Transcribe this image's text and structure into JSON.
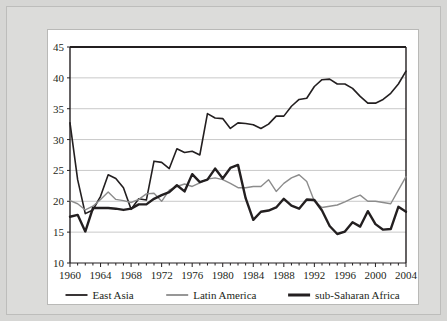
{
  "figure": {
    "frame_background": "#d6d6d4",
    "panel_background": "#ffffff",
    "has_title": false
  },
  "chart_data": {
    "type": "line",
    "title": "",
    "subtitle": "",
    "xlabel": "",
    "ylabel": "",
    "xlim": [
      1960,
      2004
    ],
    "ylim": [
      10,
      45
    ],
    "ytick_labels": [
      "10",
      "15",
      "20",
      "25",
      "30",
      "35",
      "40",
      "45"
    ],
    "yticks": [
      10,
      15,
      20,
      25,
      30,
      35,
      40,
      45
    ],
    "xtick_labels": [
      "1960",
      "1964",
      "1968",
      "1972",
      "1976",
      "1980",
      "1984",
      "1988",
      "1992",
      "1996",
      "2000",
      "2004"
    ],
    "xticks": [
      1960,
      1964,
      1968,
      1972,
      1976,
      1980,
      1984,
      1988,
      1992,
      1996,
      2000,
      2004
    ],
    "minor_xtick_interval": 1,
    "grid": "horizontal",
    "grid_color": "#c9c9c9",
    "axis_color": "#231f20",
    "legend_position": "below-axes",
    "x": [
      1960,
      1961,
      1962,
      1963,
      1964,
      1965,
      1966,
      1967,
      1968,
      1969,
      1970,
      1971,
      1972,
      1973,
      1974,
      1975,
      1976,
      1977,
      1978,
      1979,
      1980,
      1981,
      1982,
      1983,
      1984,
      1985,
      1986,
      1987,
      1988,
      1989,
      1990,
      1991,
      1992,
      1993,
      1994,
      1995,
      1996,
      1997,
      1998,
      1999,
      2000,
      2001,
      2002,
      2003,
      2004
    ],
    "series": [
      {
        "name": "East Asia",
        "color": "#231f20",
        "width": 1.6,
        "values": [
          32.7,
          23.5,
          18.0,
          18.6,
          20.8,
          24.3,
          23.7,
          22.2,
          18.7,
          20.4,
          20.2,
          26.5,
          26.3,
          25.3,
          28.5,
          27.9,
          28.1,
          27.5,
          34.2,
          33.5,
          33.4,
          31.8,
          32.7,
          32.6,
          32.4,
          31.8,
          32.5,
          33.8,
          33.8,
          35.4,
          36.5,
          36.7,
          38.6,
          39.7,
          39.8,
          39.0,
          39.0,
          38.3,
          37.0,
          35.9,
          35.9,
          36.5,
          37.5,
          39.0,
          41.1
        ]
      },
      {
        "name": "Latin America",
        "color": "#8c8c8c",
        "width": 1.4,
        "values": [
          20.1,
          19.6,
          18.6,
          19.2,
          20.3,
          21.5,
          20.3,
          20.1,
          19.8,
          20.3,
          21.2,
          21.3,
          20.0,
          21.8,
          22.4,
          22.8,
          22.4,
          23.0,
          23.6,
          23.8,
          23.5,
          22.9,
          22.2,
          22.2,
          22.4,
          22.4,
          23.5,
          21.6,
          22.9,
          23.8,
          24.3,
          23.2,
          20.0,
          19.0,
          19.2,
          19.4,
          19.9,
          20.5,
          21.0,
          20.0,
          20.0,
          19.8,
          19.6,
          21.8,
          24.0
        ]
      },
      {
        "name": "sub-Saharan Africa",
        "color": "#231f20",
        "width": 2.4,
        "values": [
          17.5,
          17.8,
          15.1,
          18.9,
          18.9,
          18.9,
          18.8,
          18.6,
          18.8,
          19.5,
          19.5,
          20.4,
          21.0,
          21.5,
          22.6,
          21.6,
          24.4,
          23.1,
          23.5,
          25.3,
          23.7,
          25.4,
          25.9,
          20.5,
          17.0,
          18.3,
          18.5,
          19.0,
          20.4,
          19.3,
          18.8,
          20.3,
          20.2,
          18.5,
          16.0,
          14.7,
          15.1,
          16.6,
          15.9,
          18.4,
          16.3,
          15.4,
          15.5,
          19.1,
          18.3
        ]
      }
    ],
    "legend": [
      {
        "label": "East Asia",
        "color": "#231f20",
        "width": 1.8
      },
      {
        "label": "Latin America",
        "color": "#8c8c8c",
        "width": 1.8
      },
      {
        "label": "sub-Saharan Africa",
        "color": "#231f20",
        "width": 3.0
      }
    ]
  }
}
